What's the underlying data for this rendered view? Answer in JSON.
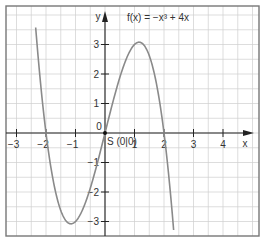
{
  "chart_data": {
    "type": "line",
    "title": "f(x) = −x³ + 4x",
    "xlabel": "x",
    "ylabel": "y",
    "xlim": [
      -3.3,
      5.2
    ],
    "ylim": [
      -3.5,
      4.4
    ],
    "x_ticks": [
      -3,
      -2,
      -1,
      1,
      2,
      3,
      4
    ],
    "x_tick_labels": [
      "−3",
      "−2",
      "−1",
      "1",
      "2",
      "3",
      "4"
    ],
    "y_ticks": [
      -3,
      -2,
      -1,
      1,
      2,
      3
    ],
    "y_tick_labels": [
      "−3",
      "−2",
      "−1",
      "1",
      "2",
      "3"
    ],
    "origin_label": "0",
    "grid": true,
    "series": [
      {
        "name": "f(x) = −x³ + 4x",
        "function": "-x^3 + 4x",
        "x_range": [
          -2.35,
          2.35
        ],
        "color": "#8a8a8a"
      }
    ],
    "annotations": [
      {
        "text": "S (0|0)",
        "x": 0,
        "y": 0
      }
    ],
    "colors": {
      "grid": "#cfcfcf",
      "axis": "#222222",
      "curve": "#8a8a8a",
      "frame": "#777777"
    }
  }
}
